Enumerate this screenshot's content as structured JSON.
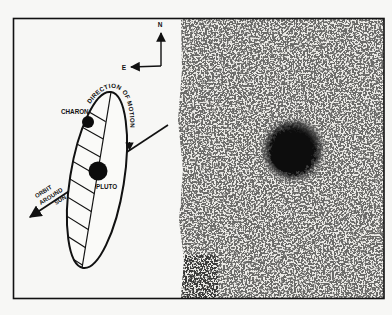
{
  "figure": {
    "compass": {
      "north": "N",
      "east": "E"
    },
    "labels": {
      "moon": "CHARON",
      "planet": "PLUTO",
      "motion": "DIRECTION OF MOTION",
      "orbit_line1": "ORBIT",
      "orbit_line2": "AROUND",
      "orbit_line3": "SUN"
    },
    "colors": {
      "ink": "#111111",
      "paper": "#f7f7f5",
      "photo_bg": "#ecebe7"
    }
  }
}
